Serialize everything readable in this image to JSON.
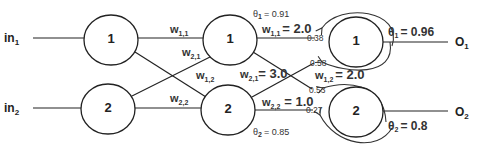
{
  "diagram": {
    "type": "neural-network",
    "inputs": [
      {
        "label": "in",
        "sub": "1"
      },
      {
        "label": "in",
        "sub": "2"
      }
    ],
    "outputs": [
      {
        "label": "O",
        "sub": "1"
      },
      {
        "label": "O",
        "sub": "2"
      }
    ],
    "layer1": [
      {
        "label": "1"
      },
      {
        "label": "2"
      }
    ],
    "layer2": [
      {
        "label": "1"
      },
      {
        "label": "2"
      }
    ],
    "layer3": [
      {
        "label": "1"
      },
      {
        "label": "2"
      }
    ],
    "layer1_weights": {
      "w11": {
        "label": "w",
        "sub": "1,1"
      },
      "w21": {
        "label": "w",
        "sub": "2,1"
      },
      "w12": {
        "label": "w",
        "sub": "1,2"
      },
      "w22": {
        "label": "w",
        "sub": "2,2"
      }
    },
    "layer2_weights": {
      "w11": {
        "label": "w",
        "sub": "1,1",
        "value": "= 2.0"
      },
      "w21": {
        "label": "w",
        "sub": "2,1",
        "value": "= 3.0"
      },
      "w12": {
        "label": "w",
        "sub": "1,2",
        "value": "= 2.0"
      },
      "w22": {
        "label": "w",
        "sub": "2,2",
        "value": "= 1.0"
      }
    },
    "layer2_thresholds": {
      "t1": {
        "symbol": "θ",
        "sub": "1",
        "value": "= 0.91"
      },
      "t2": {
        "symbol": "θ",
        "sub": "2",
        "value": "= 0.85"
      }
    },
    "layer3_thresholds": {
      "t1": {
        "symbol": "θ",
        "sub": "1",
        "value": "= 0.96"
      },
      "t2": {
        "symbol": "θ",
        "sub": "2",
        "value": "= 0.8"
      }
    },
    "feedback_values": {
      "n1_top": "0.38",
      "n1_bottom": "0.58",
      "n2_top": "0.53",
      "n2_bottom": "0.27"
    }
  }
}
